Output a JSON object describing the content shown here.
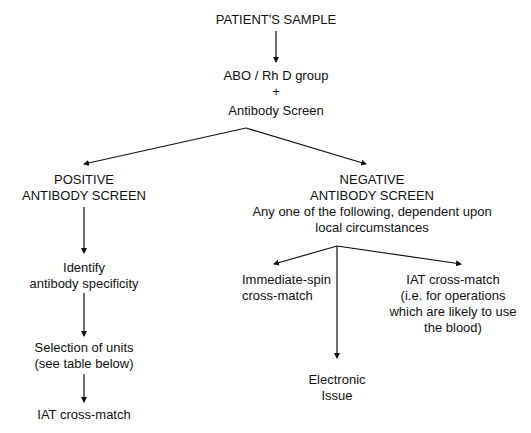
{
  "diagram": {
    "type": "flowchart",
    "nodes": {
      "sample": {
        "lines": [
          "PATIENT'S SAMPLE"
        ]
      },
      "grouping": {
        "lines": [
          "ABO / Rh D group",
          "+",
          "Antibody Screen"
        ]
      },
      "positive": {
        "lines": [
          "POSITIVE",
          "ANTIBODY SCREEN"
        ]
      },
      "negative": {
        "lines": [
          "NEGATIVE",
          "ANTIBODY SCREEN",
          "Any one of the following, dependent upon",
          "local circumstances"
        ]
      },
      "identify": {
        "lines": [
          "Identify",
          "antibody specificity"
        ]
      },
      "selection": {
        "lines": [
          "Selection of units",
          "(see table below)"
        ]
      },
      "iat_left": {
        "lines": [
          "IAT cross-match"
        ]
      },
      "immediate_spin": {
        "lines": [
          "Immediate-spin",
          "cross-match"
        ]
      },
      "electronic": {
        "lines": [
          "Electronic",
          "Issue"
        ]
      },
      "iat_right": {
        "lines": [
          "IAT cross-match",
          "(i.e. for operations",
          "which are likely to use",
          "the blood)"
        ]
      }
    },
    "edges": [
      {
        "from": "sample",
        "to": "grouping"
      },
      {
        "from": "grouping",
        "to": "positive"
      },
      {
        "from": "grouping",
        "to": "negative"
      },
      {
        "from": "positive",
        "to": "identify"
      },
      {
        "from": "identify",
        "to": "selection"
      },
      {
        "from": "selection",
        "to": "iat_left"
      },
      {
        "from": "negative",
        "to": "immediate_spin"
      },
      {
        "from": "negative",
        "to": "electronic"
      },
      {
        "from": "negative",
        "to": "iat_right"
      }
    ],
    "colors": {
      "line": "#111111",
      "text": "#111111",
      "background": "#ffffff"
    }
  }
}
